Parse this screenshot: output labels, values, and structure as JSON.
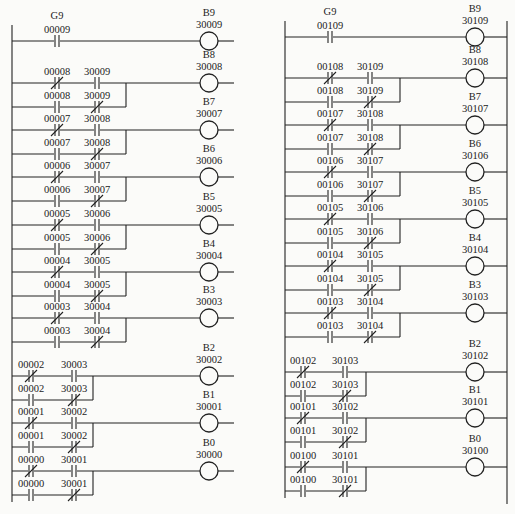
{
  "diagrams": [
    {
      "name": "ladder-left",
      "rail_x": 12,
      "right_rail": false,
      "coil_x": 209,
      "line_end_x": 234,
      "rungs": [
        {
          "y": 41,
          "coil": {
            "label": "B9",
            "addr": "30009"
          },
          "type": "single",
          "contact": {
            "label": "G9",
            "addr": "00009",
            "nc": false,
            "x": 57
          }
        },
        {
          "y": 83,
          "coil": {
            "label": "B8",
            "addr": "30008"
          },
          "type": "xor",
          "branch_x": 126,
          "row1": [
            {
              "addr": "00008",
              "nc": true,
              "x": 57
            },
            {
              "addr": "30009",
              "nc": false,
              "x": 97
            }
          ],
          "row2": [
            {
              "addr": "00008",
              "nc": false,
              "x": 57
            },
            {
              "addr": "30009",
              "nc": true,
              "x": 97
            }
          ]
        },
        {
          "y": 130,
          "coil": {
            "label": "B7",
            "addr": "30007"
          },
          "type": "xor",
          "branch_x": 126,
          "row1": [
            {
              "addr": "00007",
              "nc": true,
              "x": 57
            },
            {
              "addr": "30008",
              "nc": false,
              "x": 97
            }
          ],
          "row2": [
            {
              "addr": "00007",
              "nc": false,
              "x": 57
            },
            {
              "addr": "30008",
              "nc": true,
              "x": 97
            }
          ]
        },
        {
          "y": 177,
          "coil": {
            "label": "B6",
            "addr": "30006"
          },
          "type": "xor",
          "branch_x": 126,
          "row1": [
            {
              "addr": "00006",
              "nc": true,
              "x": 57
            },
            {
              "addr": "30007",
              "nc": false,
              "x": 97
            }
          ],
          "row2": [
            {
              "addr": "00006",
              "nc": false,
              "x": 57
            },
            {
              "addr": "30007",
              "nc": true,
              "x": 97
            }
          ]
        },
        {
          "y": 225,
          "coil": {
            "label": "B5",
            "addr": "30005"
          },
          "type": "xor",
          "branch_x": 126,
          "row1": [
            {
              "addr": "00005",
              "nc": true,
              "x": 57
            },
            {
              "addr": "30006",
              "nc": false,
              "x": 97
            }
          ],
          "row2": [
            {
              "addr": "00005",
              "nc": false,
              "x": 57
            },
            {
              "addr": "30006",
              "nc": true,
              "x": 97
            }
          ]
        },
        {
          "y": 272,
          "coil": {
            "label": "B4",
            "addr": "30004"
          },
          "type": "xor",
          "branch_x": 126,
          "row1": [
            {
              "addr": "00004",
              "nc": true,
              "x": 57
            },
            {
              "addr": "30005",
              "nc": false,
              "x": 97
            }
          ],
          "row2": [
            {
              "addr": "00004",
              "nc": false,
              "x": 57
            },
            {
              "addr": "30005",
              "nc": true,
              "x": 97
            }
          ]
        },
        {
          "y": 318,
          "coil": {
            "label": "B3",
            "addr": "30003"
          },
          "type": "xor",
          "branch_x": 126,
          "row1": [
            {
              "addr": "00003",
              "nc": true,
              "x": 57
            },
            {
              "addr": "30004",
              "nc": false,
              "x": 97
            }
          ],
          "row2": [
            {
              "addr": "00003",
              "nc": false,
              "x": 57
            },
            {
              "addr": "30004",
              "nc": true,
              "x": 97
            }
          ]
        },
        {
          "y": 376,
          "coil": {
            "label": "B2",
            "addr": "30002"
          },
          "type": "xor",
          "branch_x": 93,
          "row1": [
            {
              "addr": "00002",
              "nc": true,
              "x": 31
            },
            {
              "addr": "30003",
              "nc": false,
              "x": 74
            }
          ],
          "row2": [
            {
              "addr": "00002",
              "nc": false,
              "x": 31
            },
            {
              "addr": "30003",
              "nc": true,
              "x": 74
            }
          ]
        },
        {
          "y": 423,
          "coil": {
            "label": "B1",
            "addr": "30001"
          },
          "type": "xor",
          "branch_x": 93,
          "row1": [
            {
              "addr": "00001",
              "nc": true,
              "x": 31
            },
            {
              "addr": "30002",
              "nc": false,
              "x": 74
            }
          ],
          "row2": [
            {
              "addr": "00001",
              "nc": false,
              "x": 31
            },
            {
              "addr": "30002",
              "nc": true,
              "x": 74
            }
          ]
        },
        {
          "y": 471,
          "coil": {
            "label": "B0",
            "addr": "30000"
          },
          "type": "xor",
          "branch_x": 93,
          "row1": [
            {
              "addr": "00000",
              "nc": true,
              "x": 31
            },
            {
              "addr": "30001",
              "nc": false,
              "x": 74
            }
          ],
          "row2": [
            {
              "addr": "00000",
              "nc": false,
              "x": 31
            },
            {
              "addr": "30001",
              "nc": true,
              "x": 74
            }
          ]
        }
      ]
    },
    {
      "name": "ladder-right",
      "rail_x": 285,
      "right_rail": true,
      "right_rail_x": 507,
      "coil_x": 475,
      "line_end_x": 507,
      "rungs": [
        {
          "y": 37,
          "coil": {
            "label": "B9",
            "addr": "30109"
          },
          "type": "single",
          "contact": {
            "label": "G9",
            "addr": "00109",
            "nc": false,
            "x": 330
          }
        },
        {
          "y": 78,
          "coil": {
            "label": "B8",
            "addr": "30108"
          },
          "type": "xor",
          "branch_x": 400,
          "row1": [
            {
              "addr": "00108",
              "nc": true,
              "x": 330
            },
            {
              "addr": "30109",
              "nc": false,
              "x": 370
            }
          ],
          "row2": [
            {
              "addr": "00108",
              "nc": false,
              "x": 330
            },
            {
              "addr": "30109",
              "nc": true,
              "x": 370
            }
          ]
        },
        {
          "y": 125,
          "coil": {
            "label": "B7",
            "addr": "30107"
          },
          "type": "xor",
          "branch_x": 400,
          "row1": [
            {
              "addr": "00107",
              "nc": true,
              "x": 330
            },
            {
              "addr": "30108",
              "nc": false,
              "x": 370
            }
          ],
          "row2": [
            {
              "addr": "00107",
              "nc": false,
              "x": 330
            },
            {
              "addr": "30108",
              "nc": true,
              "x": 370
            }
          ]
        },
        {
          "y": 172,
          "coil": {
            "label": "B6",
            "addr": "30106"
          },
          "type": "xor",
          "branch_x": 400,
          "row1": [
            {
              "addr": "00106",
              "nc": true,
              "x": 330
            },
            {
              "addr": "30107",
              "nc": false,
              "x": 370
            }
          ],
          "row2": [
            {
              "addr": "00106",
              "nc": false,
              "x": 330
            },
            {
              "addr": "30107",
              "nc": true,
              "x": 370
            }
          ]
        },
        {
          "y": 219,
          "coil": {
            "label": "B5",
            "addr": "30105"
          },
          "type": "xor",
          "branch_x": 400,
          "row1": [
            {
              "addr": "00105",
              "nc": true,
              "x": 330
            },
            {
              "addr": "30106",
              "nc": false,
              "x": 370
            }
          ],
          "row2": [
            {
              "addr": "00105",
              "nc": false,
              "x": 330
            },
            {
              "addr": "30106",
              "nc": true,
              "x": 370
            }
          ]
        },
        {
          "y": 266,
          "coil": {
            "label": "B4",
            "addr": "30104"
          },
          "type": "xor",
          "branch_x": 400,
          "row1": [
            {
              "addr": "00104",
              "nc": true,
              "x": 330
            },
            {
              "addr": "30105",
              "nc": false,
              "x": 370
            }
          ],
          "row2": [
            {
              "addr": "00104",
              "nc": false,
              "x": 330
            },
            {
              "addr": "30105",
              "nc": true,
              "x": 370
            }
          ]
        },
        {
          "y": 313,
          "coil": {
            "label": "B3",
            "addr": "30103"
          },
          "type": "xor",
          "branch_x": 400,
          "row1": [
            {
              "addr": "00103",
              "nc": true,
              "x": 330
            },
            {
              "addr": "30104",
              "nc": false,
              "x": 370
            }
          ],
          "row2": [
            {
              "addr": "00103",
              "nc": false,
              "x": 330
            },
            {
              "addr": "30104",
              "nc": true,
              "x": 370
            }
          ]
        },
        {
          "y": 372,
          "coil": {
            "label": "B2",
            "addr": "30102"
          },
          "type": "xor",
          "branch_x": 366,
          "row1": [
            {
              "addr": "00102",
              "nc": true,
              "x": 303
            },
            {
              "addr": "30103",
              "nc": false,
              "x": 345
            }
          ],
          "row2": [
            {
              "addr": "00102",
              "nc": false,
              "x": 303
            },
            {
              "addr": "30103",
              "nc": true,
              "x": 345
            }
          ]
        },
        {
          "y": 418,
          "coil": {
            "label": "B1",
            "addr": "30101"
          },
          "type": "xor",
          "branch_x": 366,
          "row1": [
            {
              "addr": "00101",
              "nc": true,
              "x": 303
            },
            {
              "addr": "30102",
              "nc": false,
              "x": 345
            }
          ],
          "row2": [
            {
              "addr": "00101",
              "nc": false,
              "x": 303
            },
            {
              "addr": "30102",
              "nc": true,
              "x": 345
            }
          ]
        },
        {
          "y": 467,
          "coil": {
            "label": "B0",
            "addr": "30100"
          },
          "type": "xor",
          "branch_x": 366,
          "row1": [
            {
              "addr": "00100",
              "nc": true,
              "x": 303
            },
            {
              "addr": "30101",
              "nc": false,
              "x": 345
            }
          ],
          "row2": [
            {
              "addr": "00100",
              "nc": false,
              "x": 303
            },
            {
              "addr": "30101",
              "nc": true,
              "x": 345
            }
          ]
        }
      ]
    }
  ]
}
